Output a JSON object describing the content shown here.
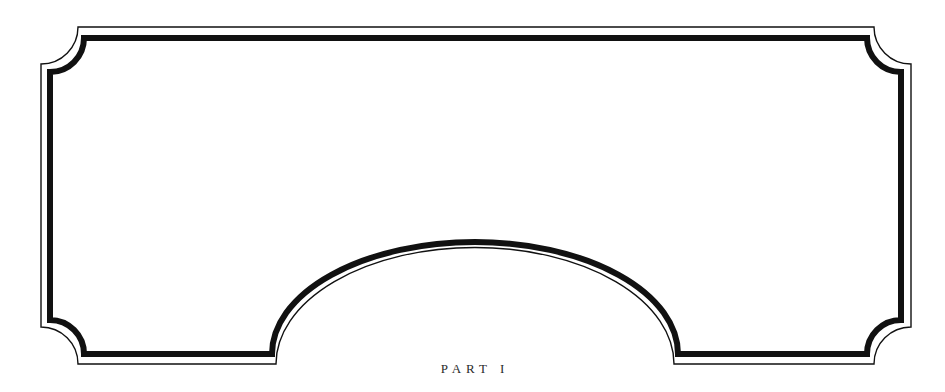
{
  "page": {
    "part_label": "PART I"
  },
  "frame": {
    "style": "double-rule ornamental cartouche",
    "outer_rule_color": "#111111",
    "inner_rule_color": "#111111",
    "background": "#ffffff"
  }
}
